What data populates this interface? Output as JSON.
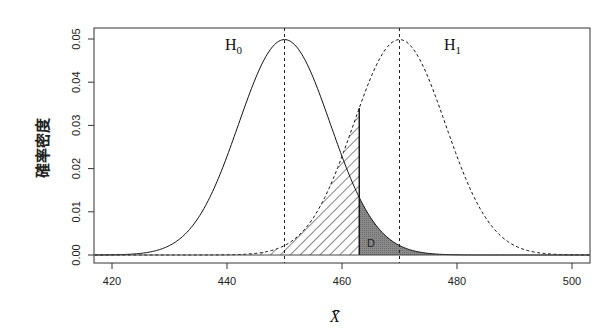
{
  "chart_data": {
    "type": "line",
    "title": "",
    "xlabel": "X̄",
    "ylabel": "確率密度",
    "xlim": [
      417,
      503
    ],
    "ylim": [
      0,
      0.052
    ],
    "x_ticks": [
      "420",
      "440",
      "460",
      "480",
      "500"
    ],
    "y_ticks": [
      "0.00",
      "0.01",
      "0.02",
      "0.03",
      "0.04",
      "0.05"
    ],
    "grid": false,
    "series": [
      {
        "name": "H0",
        "label": "H",
        "sub": "0",
        "distribution": "normal",
        "mean": 450,
        "sd": 8,
        "style": "solid",
        "peak": 0.0499
      },
      {
        "name": "H1",
        "label": "H",
        "sub": "1",
        "distribution": "normal",
        "mean": 470,
        "sd": 8,
        "style": "dashed",
        "peak": 0.0499
      }
    ],
    "critical_value": 463,
    "annotations": [
      {
        "type": "hatched-region",
        "description": "Area under H1 left of critical value (type II error)",
        "x_range": [
          440,
          463
        ]
      },
      {
        "type": "shaded-region",
        "label": "D",
        "description": "Area under H0 right of critical value",
        "x_range": [
          463,
          500
        ]
      },
      {
        "type": "vline",
        "x": 450,
        "style": "dotted"
      },
      {
        "type": "vline",
        "x": 470,
        "style": "dotted"
      }
    ]
  },
  "labels": {
    "h0_main": "H",
    "h0_sub": "0",
    "h1_main": "H",
    "h1_sub": "1",
    "region_d": "D",
    "xlabel": "X̄",
    "ylabel": "確率密度"
  }
}
